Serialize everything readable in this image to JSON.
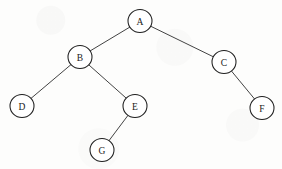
{
  "diagram": {
    "kind": "binary-tree",
    "title": "Binary tree diagram",
    "canvas": {
      "width": 282,
      "height": 169
    },
    "style": {
      "background_color": "#fdfdfc",
      "node_fill": "#ffffff",
      "node_stroke": "#1f1f1f",
      "edge_color": "#2e2e2e",
      "label_color": "#1a1a1a"
    },
    "nodes": [
      {
        "id": "A",
        "label": "A",
        "cx": 140,
        "cy": 21,
        "rx": 12,
        "ry": 11.5,
        "depth": 0
      },
      {
        "id": "B",
        "label": "B",
        "cx": 80,
        "cy": 57,
        "rx": 12,
        "ry": 11.5,
        "depth": 1
      },
      {
        "id": "C",
        "label": "C",
        "cx": 224,
        "cy": 62,
        "rx": 12,
        "ry": 11.5,
        "depth": 1
      },
      {
        "id": "D",
        "label": "D",
        "cx": 22,
        "cy": 106,
        "rx": 12,
        "ry": 11.5,
        "depth": 2
      },
      {
        "id": "E",
        "label": "E",
        "cx": 135,
        "cy": 106,
        "rx": 12,
        "ry": 11.5,
        "depth": 2
      },
      {
        "id": "F",
        "label": "F",
        "cx": 262,
        "cy": 108,
        "rx": 12,
        "ry": 11.5,
        "depth": 2
      },
      {
        "id": "G",
        "label": "G",
        "cx": 102,
        "cy": 150,
        "rx": 12,
        "ry": 11.5,
        "depth": 3
      }
    ],
    "edges": [
      {
        "from": "A",
        "to": "B",
        "side": "left"
      },
      {
        "from": "A",
        "to": "C",
        "side": "right"
      },
      {
        "from": "B",
        "to": "D",
        "side": "left"
      },
      {
        "from": "B",
        "to": "E",
        "side": "right"
      },
      {
        "from": "C",
        "to": "F",
        "side": "right"
      },
      {
        "from": "E",
        "to": "G",
        "side": "left"
      }
    ],
    "root": "A"
  }
}
